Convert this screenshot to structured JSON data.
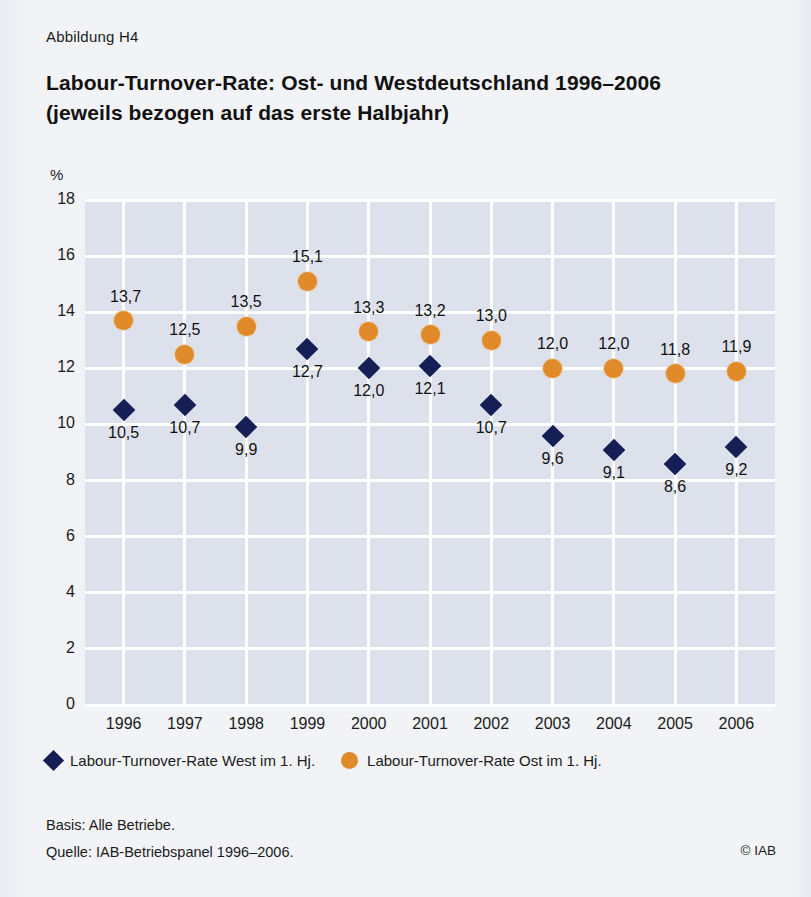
{
  "figure": {
    "label": "Abbildung H4",
    "title_line1": "Labour-Turnover-Rate: Ost- und Westdeutschland 1996–2006",
    "title_line2": "(jeweils bezogen auf das erste Halbjahr)"
  },
  "footer": {
    "basis": "Basis: Alle Betriebe.",
    "source": "Quelle: IAB-Betriebspanel 1996–2006.",
    "copyright": "© IAB"
  },
  "legend": {
    "west_label": "Labour-Turnover-Rate West im 1. Hj.",
    "ost_label": "Labour-Turnover-Rate Ost im 1. Hj.",
    "west_icon": "diamond-marker-icon",
    "ost_icon": "circle-marker-icon"
  },
  "colors": {
    "west": "#151f55",
    "ost": "#e08a2a",
    "plot_background": "#dde1ec",
    "gridlines": "#ffffff",
    "page_background": "#f1f3f6"
  },
  "chart_data": {
    "type": "scatter",
    "title": "Labour-Turnover-Rate: Ost- und Westdeutschland 1996–2006 (jeweils bezogen auf das erste Halbjahr)",
    "xlabel": "",
    "ylabel": "%",
    "unit": "%",
    "ylim": [
      0,
      18
    ],
    "yticks": [
      0,
      2,
      4,
      6,
      8,
      10,
      12,
      14,
      16,
      18
    ],
    "ytick_labels": [
      "0",
      "2",
      "4",
      "6",
      "8",
      "10",
      "12",
      "14",
      "16",
      "18"
    ],
    "grid": true,
    "legend_position": "below-axis",
    "categories": [
      "1996",
      "1997",
      "1998",
      "1999",
      "2000",
      "2001",
      "2002",
      "2003",
      "2004",
      "2005",
      "2006"
    ],
    "series": [
      {
        "name": "Labour-Turnover-Rate West im 1. Hj.",
        "marker": "diamond",
        "color": "#151f55",
        "values": [
          10.5,
          10.7,
          9.9,
          12.7,
          12.0,
          12.1,
          10.7,
          9.6,
          9.1,
          8.6,
          9.2
        ],
        "value_labels": [
          "10,5",
          "10,7",
          "9,9",
          "12,7",
          "12,0",
          "12,1",
          "10,7",
          "9,6",
          "9,1",
          "8,6",
          "9,2"
        ],
        "label_position": "below"
      },
      {
        "name": "Labour-Turnover-Rate Ost im 1. Hj.",
        "marker": "circle",
        "color": "#e08a2a",
        "values": [
          13.7,
          12.5,
          13.5,
          15.1,
          13.3,
          13.2,
          13.0,
          12.0,
          12.0,
          11.8,
          11.9
        ],
        "value_labels": [
          "13,7",
          "12,5",
          "13,5",
          "15,1",
          "13,3",
          "13,2",
          "13,0",
          "12,0",
          "12,0",
          "11,8",
          "11,9"
        ],
        "label_position": "above"
      }
    ]
  }
}
